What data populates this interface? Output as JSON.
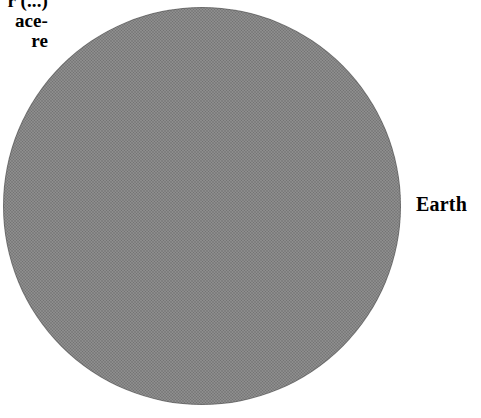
{
  "figure": {
    "background_color": "#ffffff",
    "body": {
      "name": "Earth",
      "fill_color": "#808080",
      "shape": "circle",
      "clipped_edges": "top"
    },
    "labels": {
      "earth": "Earth",
      "caption": {
        "line1": "r (...)",
        "line2": "ace-",
        "line3": "re"
      }
    }
  }
}
